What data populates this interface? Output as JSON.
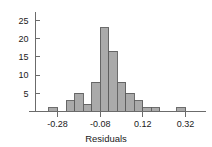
{
  "chart_data": {
    "type": "bar",
    "title": "",
    "subtitle": "",
    "xlabel": "Residuals",
    "ylabel": "",
    "grid": false,
    "legend": "none",
    "bar_fill_color": "#aaaaaa",
    "bar_edge_color": "#5d5d5d",
    "axis_color": "#6b6b6b",
    "bin_width": 0.04,
    "xlim": [
      -0.34,
      0.38
    ],
    "ylim": [
      0,
      26
    ],
    "xticks": [
      -0.28,
      -0.08,
      0.12,
      0.32
    ],
    "xtick_labels": [
      "-0.28",
      "-0.08",
      "0.12",
      "0.32"
    ],
    "yticks": [
      5,
      10,
      15,
      20,
      25
    ],
    "ytick_labels": [
      "5",
      "10",
      "15",
      "20",
      "25"
    ],
    "bin_left_edges": [
      -0.32,
      -0.28,
      -0.24,
      -0.2,
      -0.16,
      -0.12,
      -0.08,
      -0.04,
      0.0,
      0.04,
      0.08,
      0.12,
      0.16,
      0.2,
      0.24,
      0.28,
      0.32
    ],
    "categories": [
      "-0.32",
      "-0.28",
      "-0.24",
      "-0.20",
      "-0.16",
      "-0.12",
      "-0.08",
      "-0.04",
      "0.00",
      "0.04",
      "0.08",
      "0.12",
      "0.16",
      "0.20",
      "0.24",
      "0.28",
      "0.32"
    ],
    "values": [
      1,
      0,
      3,
      5,
      2,
      8,
      23,
      16.5,
      8,
      5,
      3,
      1,
      1,
      0,
      0,
      1,
      0
    ]
  },
  "figure": {
    "axis_label": "Residuals"
  }
}
